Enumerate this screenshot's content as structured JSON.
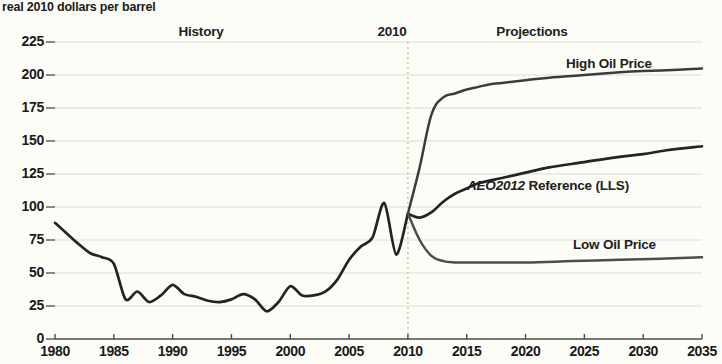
{
  "chart_data": {
    "type": "line",
    "title": "",
    "ylabel": "real 2010 dollars per barrel",
    "xlabel": "",
    "xlim": [
      1980,
      2035
    ],
    "ylim": [
      0,
      225
    ],
    "grid": true,
    "xticks": [
      1980,
      1985,
      1990,
      1995,
      2000,
      2005,
      2010,
      2015,
      2020,
      2025,
      2030,
      2035
    ],
    "yticks": [
      0,
      25,
      50,
      75,
      100,
      125,
      150,
      175,
      200,
      225
    ],
    "annotations": [
      {
        "text": "History",
        "x": 1992,
        "y": 232
      },
      {
        "text": "2010",
        "x": 2010,
        "y": 232
      },
      {
        "text": "Projections",
        "x": 2024,
        "y": 232
      }
    ],
    "divider_year": 2010,
    "legend_position": "inline-right",
    "series": [
      {
        "name": "History",
        "color": "#232323",
        "x": [
          1980,
          1981,
          1982,
          1983,
          1984,
          1985,
          1986,
          1987,
          1988,
          1989,
          1990,
          1991,
          1992,
          1993,
          1994,
          1995,
          1996,
          1997,
          1998,
          1999,
          2000,
          2001,
          2002,
          2003,
          2004,
          2005,
          2006,
          2007,
          2008,
          2009,
          2010
        ],
        "values": [
          88,
          80,
          72,
          65,
          62,
          57,
          30,
          36,
          28,
          33,
          41,
          34,
          32,
          29,
          28,
          30,
          34,
          30,
          21,
          28,
          40,
          33,
          33,
          36,
          45,
          60,
          70,
          77,
          103,
          64,
          95
        ]
      },
      {
        "name": "High Oil Price",
        "color": "#3b3b3b",
        "x": [
          2010,
          2011,
          2012,
          2013,
          2014,
          2015,
          2016,
          2017,
          2018,
          2020,
          2022,
          2025,
          2028,
          2030,
          2033,
          2035
        ],
        "values": [
          95,
          130,
          170,
          183,
          186,
          189,
          191,
          193,
          194,
          196,
          198,
          200,
          202,
          203,
          204,
          205
        ]
      },
      {
        "name": "AEO2012 Reference (LLS)",
        "color": "#232323",
        "x": [
          2010,
          2011,
          2012,
          2013,
          2014,
          2015,
          2016,
          2018,
          2020,
          2022,
          2025,
          2028,
          2030,
          2032,
          2035
        ],
        "values": [
          95,
          92,
          96,
          104,
          110,
          114,
          118,
          122,
          126,
          130,
          134,
          138,
          140,
          143,
          146
        ]
      },
      {
        "name": "Low Oil Price",
        "color": "#4c4c4c",
        "x": [
          2010,
          2011,
          2012,
          2013,
          2014,
          2015,
          2017,
          2020,
          2024,
          2028,
          2032,
          2035
        ],
        "values": [
          95,
          75,
          63,
          59,
          58,
          58,
          58,
          58,
          59,
          60,
          61,
          62
        ]
      }
    ]
  },
  "axis": {
    "y_title": "real 2010 dollars per barrel",
    "y_ticks": [
      "225",
      "200",
      "175",
      "150",
      "125",
      "100",
      "75",
      "50",
      "25",
      "0"
    ],
    "x_ticks": [
      "1980",
      "1985",
      "1990",
      "1995",
      "2000",
      "2005",
      "2010",
      "2015",
      "2020",
      "2025",
      "2030",
      "2035"
    ]
  },
  "labels": {
    "history": "History",
    "divider_year": "2010",
    "projections": "Projections",
    "high_oil_price": "High Oil Price",
    "reference_italic": "AEO2012",
    "reference_rest": " Reference (LLS)",
    "low_oil_price": "Low Oil Price"
  },
  "colors": {
    "background": "#fdfdf8",
    "axis": "#4a4a48",
    "grid": "#dcdcd2",
    "line_dark": "#232323",
    "line_mid": "#3b3b3b",
    "line_light": "#4c4c4c",
    "divider": "#c9c49a"
  }
}
